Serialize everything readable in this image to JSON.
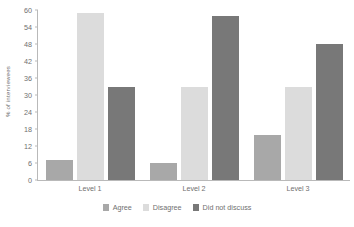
{
  "chart_data": {
    "type": "bar",
    "title": "",
    "xlabel": "",
    "ylabel": "% of interviewees",
    "categories": [
      "Level 1",
      "Level 2",
      "Level 3"
    ],
    "series": [
      {
        "name": "Agree",
        "color": "#a8a8a8",
        "values": [
          7,
          6,
          16
        ]
      },
      {
        "name": "Disagree",
        "color": "#dcdcdc",
        "values": [
          59,
          33,
          33
        ]
      },
      {
        "name": "Did not discuss",
        "color": "#787878",
        "values": [
          33,
          58,
          48
        ]
      }
    ],
    "ylim": [
      0,
      60
    ],
    "yticks": [
      0,
      6,
      12,
      18,
      24,
      30,
      36,
      42,
      48,
      54,
      60
    ],
    "grid": false,
    "legend_position": "bottom",
    "axis_color": "#b9b9b9",
    "text_color": "#6f6f6f",
    "background": "#ffffff"
  }
}
